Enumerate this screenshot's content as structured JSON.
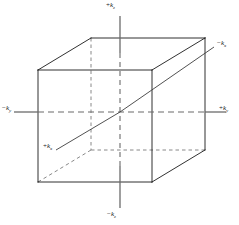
{
  "figure": {
    "type": "3d-axes-cube",
    "background_color": "#ffffff",
    "line_color": "#1a1a1a",
    "axis_color": "#4d4d4d",
    "hidden_edge_style": "dashed"
  },
  "axes": [
    {
      "name": "kz-positive",
      "sign": "+",
      "symbol": "k",
      "subscript": "z",
      "label": "+kz",
      "position": "top"
    },
    {
      "name": "kz-negative",
      "sign": "−",
      "symbol": "k",
      "subscript": "z",
      "label": "−kz",
      "position": "bottom"
    },
    {
      "name": "ky-negative",
      "sign": "−",
      "symbol": "k",
      "subscript": "y",
      "label": "−ky",
      "position": "left"
    },
    {
      "name": "ky-positive",
      "sign": "+",
      "symbol": "k",
      "subscript": "y",
      "label": "+ky",
      "position": "right"
    },
    {
      "name": "kx-negative",
      "sign": "−",
      "symbol": "k",
      "subscript": "x",
      "label": "−kx",
      "position": "upper-right-diagonal"
    },
    {
      "name": "kx-positive",
      "sign": "+",
      "symbol": "k",
      "subscript": "x",
      "label": "+kx",
      "position": "lower-left-diagonal"
    }
  ],
  "geometry": {
    "origin": {
      "x": 120,
      "y": 112
    },
    "front_face": {
      "top_left": {
        "x": 38,
        "y": 70
      },
      "top_right": {
        "x": 152,
        "y": 70
      },
      "bottom_right": {
        "x": 152,
        "y": 182
      },
      "bottom_left": {
        "x": 38,
        "y": 182
      }
    },
    "back_face": {
      "top_left": {
        "x": 91,
        "y": 38
      },
      "top_right": {
        "x": 205,
        "y": 38
      },
      "bottom_right": {
        "x": 205,
        "y": 150
      },
      "bottom_left": {
        "x": 91,
        "y": 150
      }
    },
    "hidden_vertex": {
      "x": 91,
      "y": 150
    },
    "axis_endpoints": {
      "kz_top": {
        "x": 120,
        "y": 16
      },
      "kz_bottom": {
        "x": 120,
        "y": 208
      },
      "ky_left": {
        "x": 14,
        "y": 112
      },
      "ky_right": {
        "x": 226,
        "y": 112
      },
      "kx_upper_right": {
        "x": 214,
        "y": 47
      },
      "kx_lower_left": {
        "x": 56,
        "y": 150
      }
    }
  }
}
